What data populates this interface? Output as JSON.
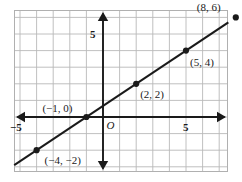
{
  "figure": {
    "type": "coordinate-plane-line-graph",
    "background_color": "#ffffff",
    "grid_color": "#b9b9b9",
    "grid_border_color": "#b0b0b0",
    "axis_color": "#1a1a1a",
    "line_color": "#1a1a1a",
    "point_color": "#1a1a1a",
    "label_color": "#1a1a1a"
  },
  "axes": {
    "origin_label": "O",
    "x_axis": {
      "name": "x-axis",
      "min": -5.35,
      "max": 7.55,
      "ticks": [
        {
          "value": -5,
          "label": "−5"
        },
        {
          "value": 5,
          "label": "5"
        }
      ],
      "arrows": [
        "left",
        "right"
      ]
    },
    "y_axis": {
      "name": "y-axis",
      "min": -3.9,
      "max": 6.45,
      "ticks": [
        {
          "value": 5,
          "label": "5"
        }
      ],
      "arrows": [
        "up",
        "down"
      ]
    },
    "grid": {
      "on": true,
      "spacing": 1
    }
  },
  "chart_data": {
    "type": "line",
    "title": "",
    "xlabel": "",
    "ylabel": "",
    "xlim": [
      -5.35,
      7.55
    ],
    "ylim": [
      -3.9,
      6.45
    ],
    "grid": true,
    "legend": "none",
    "line": {
      "name": "plotted-line",
      "slope": 0.6666666667,
      "intercept": 0.6666666667,
      "equation": "y = (2/3)x + 2/3",
      "x_start": -5.35,
      "x_end": 7.55,
      "extends_beyond_points": true
    },
    "points": [
      {
        "x": -4,
        "y": -2,
        "label": "(−4, −2)",
        "label_dx": 8,
        "label_dy": 14
      },
      {
        "x": -1,
        "y": 0,
        "label": "(−1, 0)",
        "label_dx": -44,
        "label_dy": -5
      },
      {
        "x": 2,
        "y": 2,
        "label": "(2, 2)",
        "label_dx": 4,
        "label_dy": 14
      },
      {
        "x": 5,
        "y": 4,
        "label": "(5, 4)",
        "label_dx": 4,
        "label_dy": 15
      },
      {
        "x": 8,
        "y": 6,
        "label": "(8, 6)",
        "label_dx": -39,
        "label_dy": -6
      }
    ]
  }
}
